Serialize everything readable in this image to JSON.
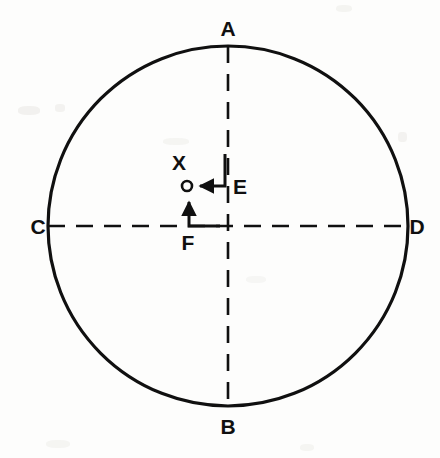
{
  "figure": {
    "type": "geometry-diagram",
    "background_color": "#fdfdfc",
    "stroke_color": "#101010",
    "width": 440,
    "height": 458,
    "circle": {
      "name": "main-circle",
      "center_x": 228,
      "center_y": 226,
      "radius": 180,
      "stroke_width": 3.2,
      "fill": "none"
    },
    "diameters": [
      {
        "name": "vertical-diameter",
        "from": "A",
        "to": "B",
        "x1": 228,
        "y1": 46,
        "x2": 228,
        "y2": 406,
        "style": "dashed",
        "dash": "17 11",
        "stroke_width": 2.6
      },
      {
        "name": "horizontal-diameter",
        "from": "C",
        "to": "D",
        "x1": 48,
        "y1": 226,
        "x2": 408,
        "y2": 226,
        "style": "dashed",
        "dash": "17 11",
        "stroke_width": 2.6
      }
    ],
    "vertex_labels": [
      {
        "id": "A",
        "text": "A",
        "x": 228,
        "y": 36,
        "anchor": "middle"
      },
      {
        "id": "B",
        "text": "B",
        "x": 228,
        "y": 434,
        "anchor": "middle"
      },
      {
        "id": "C",
        "text": "C",
        "x": 38,
        "y": 234,
        "anchor": "middle"
      },
      {
        "id": "D",
        "text": "D",
        "x": 417,
        "y": 234,
        "anchor": "middle"
      }
    ],
    "marker_point": {
      "name": "point-x",
      "label": "X",
      "cx": 187,
      "cy": 186,
      "r": 5.0,
      "stroke_width": 2.6,
      "fill": "none",
      "label_x": 179,
      "label_y": 170
    },
    "component_arrows": [
      {
        "id": "E",
        "label": "E",
        "description": "horizontal component arrow pointing left toward point X",
        "path": "M 225 154 L 225 186 L 199 186",
        "arrow_tip_x": 197,
        "arrow_tip_y": 186,
        "direction": "left",
        "stroke_width": 3.0,
        "label_x": 240,
        "label_y": 194
      },
      {
        "id": "F",
        "label": "F",
        "description": "vertical component arrow pointing up toward point X",
        "path": "M 219 226 L 189 226 L 189 200",
        "arrow_tip_x": 189,
        "arrow_tip_y": 197,
        "direction": "up",
        "stroke_width": 3.0,
        "label_x": 188,
        "label_y": 250
      }
    ]
  }
}
